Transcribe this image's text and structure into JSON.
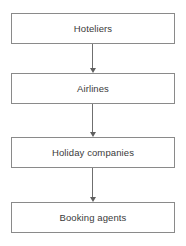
{
  "diagram": {
    "type": "vertical-flowchart",
    "orientation": "top-to-bottom",
    "background_color": "#ffffff",
    "box_border_color": "#8a8a8a",
    "text_color": "#3a3a3a",
    "arrow_color": "#6f6f6f",
    "nodes": [
      {
        "id": "node-1",
        "label": "Hoteliers"
      },
      {
        "id": "node-2",
        "label": "Airlines"
      },
      {
        "id": "node-3",
        "label": "Holiday companies"
      },
      {
        "id": "node-4",
        "label": "Booking agents"
      }
    ],
    "edges": [
      {
        "from": "node-1",
        "to": "node-2",
        "style": "solid-arrow-down"
      },
      {
        "from": "node-2",
        "to": "node-3",
        "style": "solid-arrow-down"
      },
      {
        "from": "node-3",
        "to": "node-4",
        "style": "solid-arrow-down"
      }
    ]
  }
}
